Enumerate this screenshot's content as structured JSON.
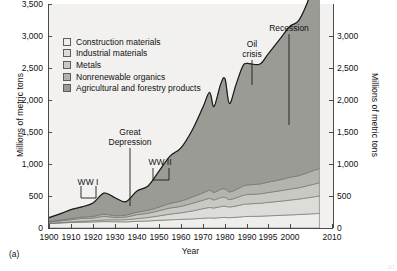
{
  "figure": {
    "panel_tag": "(a)",
    "corner_mark": "10",
    "plot_bg": "#f2f1ef",
    "axis_color": "#4a4a4a",
    "line_color": "#1c1c1c"
  },
  "legend": {
    "items": [
      {
        "label": "Construction materials",
        "color": "#eeeeec"
      },
      {
        "label": "Industrial materials",
        "color": "#dcdcd8"
      },
      {
        "label": "Metals",
        "color": "#c9c9c4"
      },
      {
        "label": "Nonrenewable organics",
        "color": "#b4b4ae"
      },
      {
        "label": "Agricultural and forestry products",
        "color": "#9b9b95"
      }
    ]
  },
  "annotations": [
    {
      "name": "ww1",
      "text": "WW I",
      "x": 88,
      "y": 178
    },
    {
      "name": "great-depression",
      "text_line1": "Great",
      "text_line2": "Depression",
      "x": 130,
      "y": 128
    },
    {
      "name": "ww2",
      "text": "WW II",
      "x": 160,
      "y": 158
    },
    {
      "name": "oil-crisis",
      "text_line1": "Oil",
      "text_line2": "crisis",
      "x": 252,
      "y": 40
    },
    {
      "name": "recession",
      "text": "Recession",
      "x": 289,
      "y": 24
    }
  ],
  "chart_data": {
    "type": "area",
    "title": "",
    "subtitle": "",
    "xlabel": "Year",
    "ylabel": "Millions of metric tons",
    "ylabel_right": "Millions of metric tons",
    "legend_position": "top-left inside plot",
    "grid": false,
    "stacked": true,
    "xlim": [
      1900,
      2010
    ],
    "ylim_left": [
      0,
      3500
    ],
    "ylim_right": [
      0,
      3000
    ],
    "yticks_left": [
      "0",
      "500",
      "1,000",
      "1,500",
      "2,000",
      "2,500",
      "3,000",
      "3,500"
    ],
    "ytick_values_left": [
      0,
      500,
      1000,
      1500,
      2000,
      2500,
      3000,
      3500
    ],
    "yticks_right": [
      "0",
      "500",
      "1,000",
      "1,500",
      "2,000",
      "2,500",
      "3,000"
    ],
    "ytick_values_right": [
      0,
      500,
      1000,
      1500,
      2000,
      2500,
      3000
    ],
    "xticks": [
      "1900",
      "1910",
      "1920",
      "1930",
      "1940",
      "1950",
      "1960",
      "1970",
      "1980",
      "1990",
      "1995",
      "2000",
      "2010"
    ],
    "xtick_values": [
      1900,
      1910,
      1920,
      1930,
      1940,
      1950,
      1960,
      1970,
      1980,
      1990,
      1995,
      2000,
      2010
    ],
    "x": [
      1900,
      1905,
      1910,
      1915,
      1920,
      1925,
      1930,
      1935,
      1940,
      1945,
      1950,
      1955,
      1960,
      1965,
      1970,
      1973,
      1975,
      1978,
      1980,
      1982,
      1985,
      1988,
      1990,
      1993,
      1995,
      1998,
      2000,
      2002,
      2004,
      2006,
      2007
    ],
    "series": [
      {
        "name": "Agricultural and forestry products",
        "values": [
          70,
          78,
          86,
          92,
          95,
          100,
          98,
          96,
          104,
          110,
          120,
          128,
          134,
          142,
          152,
          158,
          155,
          162,
          165,
          160,
          168,
          176,
          180,
          184,
          190,
          198,
          205,
          210,
          218,
          224,
          228
        ]
      },
      {
        "name": "Nonrenewable organics",
        "values": [
          4,
          6,
          9,
          13,
          18,
          26,
          30,
          34,
          42,
          54,
          70,
          88,
          104,
          124,
          150,
          162,
          158,
          172,
          176,
          168,
          176,
          190,
          196,
          202,
          210,
          222,
          232,
          240,
          252,
          266,
          272
        ]
      },
      {
        "name": "Metals",
        "values": [
          18,
          26,
          34,
          44,
          42,
          56,
          36,
          42,
          62,
          66,
          80,
          96,
          100,
          118,
          132,
          142,
          126,
          140,
          138,
          116,
          126,
          142,
          146,
          148,
          154,
          164,
          172,
          176,
          188,
          200,
          206
        ]
      },
      {
        "name": "Industrial materials",
        "values": [
          10,
          14,
          18,
          22,
          26,
          34,
          28,
          30,
          40,
          46,
          58,
          72,
          84,
          98,
          116,
          126,
          118,
          130,
          132,
          120,
          130,
          144,
          150,
          154,
          162,
          174,
          184,
          190,
          202,
          216,
          222
        ]
      },
      {
        "name": "Construction materials",
        "values": [
          60,
          96,
          140,
          160,
          210,
          330,
          280,
          210,
          330,
          380,
          560,
          740,
          830,
          1040,
          1340,
          1530,
          1340,
          1640,
          1720,
          1380,
          1640,
          1870,
          1900,
          1870,
          2000,
          2220,
          2360,
          2420,
          2640,
          2980,
          3180
        ]
      }
    ],
    "total_top": [
      162,
      220,
      287,
      331,
      391,
      546,
      472,
      412,
      578,
      656,
      888,
      1124,
      1252,
      1522,
      1890,
      2118,
      1897,
      2244,
      2331,
      1944,
      2240,
      2522,
      2572,
      2558,
      2716,
      2978,
      3153,
      3236,
      3500,
      3886,
      4108
    ]
  }
}
